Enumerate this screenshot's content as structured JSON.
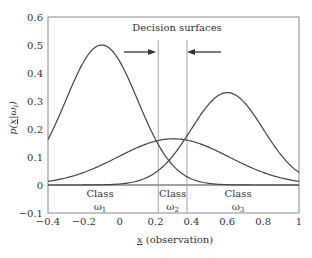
{
  "chart_data": {
    "type": "line",
    "title": "",
    "annotation": "Decision surfaces",
    "xlabel": "x (observation)",
    "xlabel_underlined": "x",
    "ylabel": "p(x|ωi)",
    "xlim": [
      -0.4,
      1
    ],
    "ylim": [
      -0.1,
      0.6
    ],
    "xticks": [
      -0.4,
      -0.2,
      0,
      0.2,
      0.4,
      0.6,
      0.8,
      1
    ],
    "xtick_labels": [
      "−0.4",
      "−0.2",
      "0",
      "0.2",
      "0.4",
      "0.6",
      "0.8",
      "1"
    ],
    "yticks": [
      -0.1,
      0,
      0.1,
      0.2,
      0.3,
      0.4,
      0.5,
      0.6
    ],
    "ytick_labels": [
      "−0.1",
      "0",
      "0.1",
      "0.2",
      "0.3",
      "0.4",
      "0.5",
      "0.6"
    ],
    "grid": false,
    "series": [
      {
        "name": "ω1",
        "shape": "gaussian",
        "mean": -0.1,
        "sigma": 0.2,
        "peak": 0.5
      },
      {
        "name": "ω2",
        "shape": "gaussian",
        "mean": 0.3,
        "sigma": 0.31,
        "peak": 0.165
      },
      {
        "name": "ω3",
        "shape": "gaussian",
        "mean": 0.6,
        "sigma": 0.2,
        "peak": 0.33
      }
    ],
    "decision_boundaries": [
      0.215,
      0.375
    ],
    "regions": [
      {
        "label": "Class",
        "sub": "ω",
        "index": "1",
        "x": -0.11
      },
      {
        "label": "Class",
        "sub": "ω",
        "index": "2",
        "x": 0.295
      },
      {
        "label": "Class",
        "sub": "ω",
        "index": "3",
        "x": 0.66
      }
    ]
  }
}
